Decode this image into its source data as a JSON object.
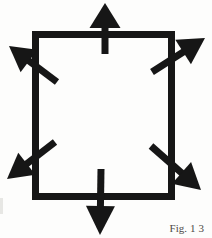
{
  "figure": {
    "caption": {
      "label": "Fig.",
      "number": "13"
    },
    "colors": {
      "ink": "#161616",
      "background": "#fdfdfc"
    },
    "canvas": {
      "width": 212,
      "height": 238
    },
    "square": {
      "x": 35.5,
      "y": 34.5,
      "width": 136,
      "height": 162,
      "stroke_width": 7
    },
    "arrows": [
      {
        "name": "arrow-top",
        "direction": "up",
        "from": [
          105,
          54
        ],
        "to": [
          105,
          3
        ],
        "head_length": 25,
        "head_width": 31,
        "stem_width": 7
      },
      {
        "name": "arrow-top-left",
        "direction": "up-left",
        "from": [
          57,
          82
        ],
        "to": [
          9,
          46
        ],
        "head_length": 25,
        "head_width": 28,
        "stem_width": 7
      },
      {
        "name": "arrow-top-right",
        "direction": "up-right",
        "from": [
          152,
          72
        ],
        "to": [
          205,
          38
        ],
        "head_length": 26,
        "head_width": 29,
        "stem_width": 7
      },
      {
        "name": "arrow-bottom-left",
        "direction": "down-left",
        "from": [
          55,
          142
        ],
        "to": [
          7,
          179
        ],
        "head_length": 25,
        "head_width": 28,
        "stem_width": 7
      },
      {
        "name": "arrow-bottom-right",
        "direction": "down-right",
        "from": [
          151,
          146
        ],
        "to": [
          201,
          190
        ],
        "head_length": 26,
        "head_width": 29,
        "stem_width": 7
      },
      {
        "name": "arrow-bottom",
        "direction": "down",
        "from": [
          101,
          169
        ],
        "to": [
          100,
          235
        ],
        "head_length": 29,
        "head_width": 29,
        "stem_width": 7
      }
    ]
  }
}
